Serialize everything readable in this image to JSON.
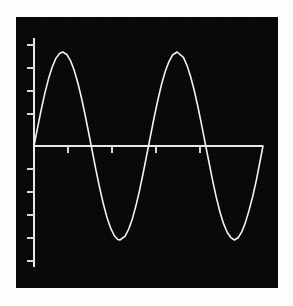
{
  "figure": {
    "background_color": "#fdfdfb",
    "panel_color": "#080808",
    "panel": {
      "left": 16,
      "top": 17,
      "width": 262,
      "height": 271
    }
  },
  "chart_data": {
    "type": "line",
    "title": "",
    "subtitle": "",
    "xlabel": "",
    "ylabel": "",
    "grid": false,
    "legend": null,
    "line_color": "#f2f2ee",
    "axis_color": "#e8e8e6",
    "background_color": "#080808",
    "function": "sin(x)",
    "amplitude": 1,
    "periods": 2,
    "xlim": [
      0,
      12.566
    ],
    "ylim": [
      -1.35,
      1.15
    ],
    "x_tick_values": [
      1.571,
      3.142,
      4.712,
      6.283
    ],
    "y_tick_values": [
      1.0,
      0.75,
      0.5,
      0.25,
      -0.25,
      -0.5,
      -0.75,
      -1.0,
      -1.25
    ],
    "x_tick_labels": [],
    "y_tick_labels": [],
    "series": [
      {
        "name": "sin(x)",
        "x": [
          0.0,
          0.2,
          0.4,
          0.6,
          0.8,
          1.0,
          1.2,
          1.4,
          1.571,
          1.8,
          2.0,
          2.2,
          2.4,
          2.6,
          2.8,
          3.0,
          3.142,
          3.4,
          3.6,
          3.8,
          4.0,
          4.2,
          4.4,
          4.6,
          4.712,
          5.0,
          5.2,
          5.4,
          5.6,
          5.8,
          6.0,
          6.283,
          6.6,
          6.8,
          7.0,
          7.2,
          7.4,
          7.6,
          7.854,
          8.2,
          8.4,
          8.6,
          8.8,
          9.0,
          9.2,
          9.425,
          9.8,
          10.0,
          10.2,
          10.4,
          10.6,
          10.8,
          10.996,
          11.2,
          11.4,
          11.6,
          11.8,
          12.0,
          12.2,
          12.566
        ],
        "y": [
          0.0,
          0.199,
          0.389,
          0.565,
          0.717,
          0.841,
          0.932,
          0.985,
          1.0,
          0.974,
          0.909,
          0.808,
          0.675,
          0.516,
          0.335,
          0.141,
          0.0,
          -0.256,
          -0.443,
          -0.612,
          -0.757,
          -0.872,
          -0.952,
          -0.994,
          -1.0,
          -0.959,
          -0.883,
          -0.773,
          -0.631,
          -0.465,
          -0.279,
          0.0,
          0.311,
          0.492,
          0.657,
          0.793,
          0.895,
          0.968,
          1.0,
          0.942,
          0.855,
          0.734,
          0.585,
          0.412,
          0.223,
          0.0,
          -0.366,
          -0.544,
          -0.7,
          -0.826,
          -0.917,
          -0.974,
          -1.0,
          -0.976,
          -0.914,
          -0.815,
          -0.685,
          -0.537,
          -0.365,
          0.0
        ]
      }
    ],
    "data_points": {
      "first_peak": {
        "x": 1.571,
        "y": 1.0
      },
      "first_trough": {
        "x": 4.712,
        "y": -1.0
      },
      "second_peak": {
        "x": 7.854,
        "y": 1.0
      },
      "second_trough": {
        "x": 10.996,
        "y": -1.0
      },
      "zero_crossings": [
        0.0,
        3.142,
        6.283,
        9.425,
        12.566
      ]
    }
  },
  "axes": {
    "y_axis": {
      "x": 18,
      "y_top": 21,
      "y_bottom": 250
    },
    "x_axis": {
      "y": 129,
      "x_left": 18,
      "x_right": 247
    },
    "y_tick_length": 7,
    "x_tick_length": 7,
    "y_tick_positions": [
      28,
      51,
      74,
      97,
      152,
      175,
      198,
      221,
      244
    ],
    "x_tick_positions": [
      52,
      96,
      140,
      184
    ]
  }
}
